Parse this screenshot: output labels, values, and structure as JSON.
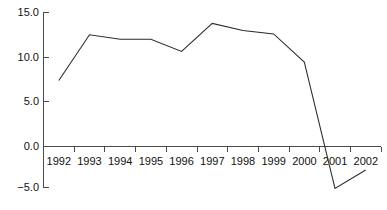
{
  "chart_data": {
    "type": "line",
    "title": "",
    "subtitle": "",
    "xlabel": "",
    "ylabel": "",
    "categories": [
      "1992",
      "1993",
      "1994",
      "1995",
      "1996",
      "1997",
      "1998",
      "1999",
      "2000",
      "2001",
      "2002"
    ],
    "values": [
      7.2,
      12.4,
      11.9,
      11.9,
      10.5,
      13.7,
      12.9,
      12.5,
      9.3,
      -5.1,
      -3.0
    ],
    "series": [
      {
        "name": "",
        "values": [
          7.2,
          12.4,
          11.9,
          11.9,
          10.5,
          13.7,
          12.9,
          12.5,
          9.3,
          -5.1,
          -3.0
        ]
      }
    ],
    "ylim": [
      -5.0,
      15.0
    ],
    "ytick_labels": [
      "15.0",
      "10.0",
      "5.0",
      "0.0",
      "−5.0"
    ],
    "ytick_values": [
      15.0,
      10.0,
      5.0,
      0.0,
      -5.0
    ],
    "xtick_labels": [
      "1992",
      "1993",
      "1994",
      "1995",
      "1996",
      "1997",
      "1998",
      "1999",
      "2000",
      "2001",
      "2002"
    ],
    "grid": false,
    "legend": false,
    "legend_position": "none",
    "line_color": "#2b2b2b",
    "axis_color": "#4a4a4a",
    "background_color": "#ffffff",
    "zero_line_value": 0.0,
    "annotations": []
  }
}
